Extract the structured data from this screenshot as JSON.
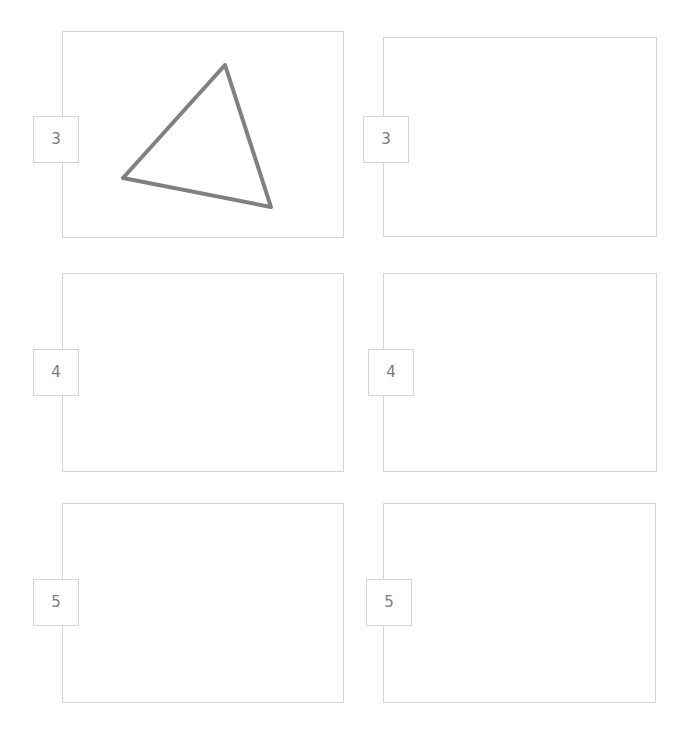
{
  "page": {
    "background_color": "#ffffff",
    "width": 684,
    "height": 737,
    "panel_border_color": "#d5d5d5",
    "label_text_color": "#7b7b7b",
    "shape_stroke_color": "#808080"
  },
  "panels": [
    {
      "id": "panel-r1c1",
      "label": "3",
      "row": 1,
      "column": 1,
      "x": 62,
      "y": 31,
      "width": 282,
      "height": 207,
      "label_x": 33,
      "label_y": 116,
      "has_content": true,
      "shape": {
        "type": "triangle",
        "stroke_color": "#808080",
        "stroke_width": 4,
        "points": "163,34 61,147 209,176"
      }
    },
    {
      "id": "panel-r1c2",
      "label": "3",
      "row": 1,
      "column": 2,
      "x": 383,
      "y": 37,
      "width": 274,
      "height": 200,
      "label_x": 363,
      "label_y": 116,
      "has_content": false,
      "shape": null
    },
    {
      "id": "panel-r2c1",
      "label": "4",
      "row": 2,
      "column": 1,
      "x": 62,
      "y": 273,
      "width": 282,
      "height": 199,
      "label_x": 33,
      "label_y": 349,
      "has_content": false,
      "shape": null
    },
    {
      "id": "panel-r2c2",
      "label": "4",
      "row": 2,
      "column": 2,
      "x": 383,
      "y": 273,
      "width": 274,
      "height": 199,
      "label_x": 368,
      "label_y": 349,
      "has_content": false,
      "shape": null
    },
    {
      "id": "panel-r3c1",
      "label": "5",
      "row": 3,
      "column": 1,
      "x": 62,
      "y": 503,
      "width": 282,
      "height": 200,
      "label_x": 33,
      "label_y": 579,
      "has_content": false,
      "shape": null
    },
    {
      "id": "panel-r3c2",
      "label": "5",
      "row": 3,
      "column": 2,
      "x": 383,
      "y": 503,
      "width": 273,
      "height": 200,
      "label_x": 366,
      "label_y": 579,
      "has_content": false,
      "shape": null
    }
  ]
}
